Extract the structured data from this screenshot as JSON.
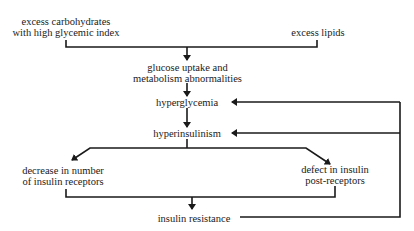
{
  "diagram": {
    "type": "flowchart",
    "nodes": {
      "carbs": {
        "line1": "excess carbohydrates",
        "line2": "with high glycemic index"
      },
      "lipids": {
        "line1": "excess lipids"
      },
      "glucose": {
        "line1": "glucose uptake and",
        "line2": "metabolism abnormalities"
      },
      "hyperglycemia": {
        "line1": "hyperglycemia"
      },
      "hyperinsulinism": {
        "line1": "hyperinsulinism"
      },
      "receptors": {
        "line1": "decrease in number",
        "line2": "of insulin receptors"
      },
      "postreceptors": {
        "line1": "defect in insulin",
        "line2": "post-receptors"
      },
      "resistance": {
        "line1": "insulin resistance"
      }
    },
    "edges": [
      {
        "from": "carbs",
        "to": "glucose"
      },
      {
        "from": "lipids",
        "to": "glucose"
      },
      {
        "from": "glucose",
        "to": "hyperglycemia"
      },
      {
        "from": "hyperglycemia",
        "to": "hyperinsulinism"
      },
      {
        "from": "hyperinsulinism",
        "to": "receptors"
      },
      {
        "from": "hyperinsulinism",
        "to": "postreceptors"
      },
      {
        "from": "receptors",
        "to": "resistance"
      },
      {
        "from": "postreceptors",
        "to": "resistance"
      },
      {
        "from": "resistance",
        "to": "hyperglycemia",
        "kind": "feedback"
      },
      {
        "from": "resistance",
        "to": "hyperinsulinism",
        "kind": "feedback"
      }
    ],
    "line_color": "#1a1a1a"
  }
}
